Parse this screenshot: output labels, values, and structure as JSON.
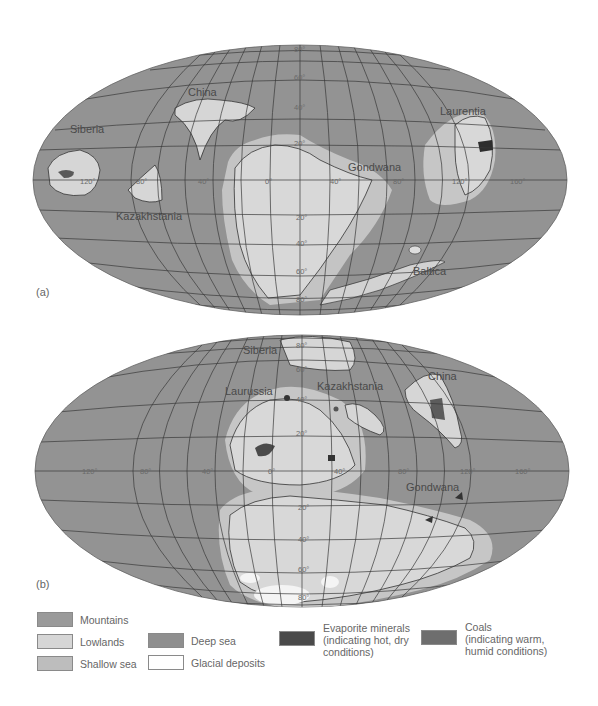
{
  "figure": {
    "panels": [
      {
        "id": "a",
        "label": "(a)",
        "continents": [
          "Siberia",
          "China",
          "Kazakhstania",
          "Gondwana",
          "Laurentia",
          "Baltica"
        ],
        "longitude_labels": [
          "120°",
          "80°",
          "40°",
          "0°",
          "40°",
          "80°",
          "120°",
          "160°"
        ],
        "latitude_labels": [
          "80°",
          "60°",
          "40°",
          "20°",
          "20°",
          "40°",
          "60°",
          "80°"
        ]
      },
      {
        "id": "b",
        "label": "(b)",
        "continents": [
          "Siberia",
          "Laurussia",
          "Kazakhstania",
          "China",
          "Gondwana"
        ],
        "longitude_labels": [
          "120°",
          "80°",
          "40°",
          "0°",
          "40°",
          "80°",
          "120°",
          "160°"
        ],
        "latitude_labels": [
          "80°",
          "60°",
          "40°",
          "20°",
          "20°",
          "40°",
          "60°",
          "80°"
        ]
      }
    ]
  },
  "legend": {
    "items": [
      {
        "key": "mountains",
        "label": "Mountains",
        "color": "#9a9a9a"
      },
      {
        "key": "lowlands",
        "label": "Lowlands",
        "color": "#d6d6d6"
      },
      {
        "key": "shallow_sea",
        "label": "Shallow sea",
        "color": "#bdbdbd"
      },
      {
        "key": "deep_sea",
        "label": "Deep sea",
        "color": "#8f8f8f"
      },
      {
        "key": "glacial",
        "label": "Glacial deposits",
        "color": "#ffffff"
      },
      {
        "key": "evaporite",
        "label_line1": "Evaporite minerals",
        "label_line2": "(indicating hot, dry",
        "label_line3": "conditions)",
        "color": "#4a4a4a"
      },
      {
        "key": "coals",
        "label_line1": "Coals",
        "label_line2": "(indicating warm,",
        "label_line3": "humid conditions)",
        "color": "#6e6e6e"
      }
    ]
  }
}
